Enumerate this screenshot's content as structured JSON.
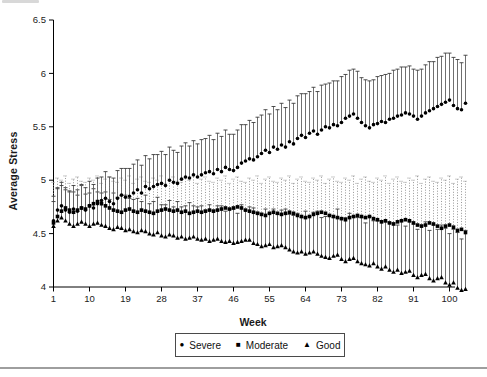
{
  "page": {
    "background": "#ffffff",
    "rule_color": "#9e9e9e"
  },
  "icons": {
    "circle_glyph": "●",
    "square_glyph": "■",
    "triangle_glyph": "▲"
  },
  "chart_data": {
    "type": "scatter",
    "title": "",
    "xlabel": "Week",
    "ylabel": "Average Stress",
    "xlim": [
      1,
      105
    ],
    "ylim": [
      4,
      6.5
    ],
    "grid": false,
    "legend_position": "bottom",
    "x_ticks": [
      1,
      10,
      19,
      28,
      37,
      46,
      55,
      64,
      73,
      82,
      91,
      100
    ],
    "y_ticks": [
      4,
      4.5,
      5,
      5.5,
      6,
      6.5
    ],
    "y_tick_labels": [
      "4",
      "4.5",
      "5",
      "5.5",
      "6",
      "6.5"
    ],
    "weeks_first": 1,
    "weeks_count": 104,
    "error_bar_note": "one-sided error bars drawn upward from each marker",
    "series": [
      {
        "name": "Severe",
        "marker": "circle",
        "bar_style": "solid",
        "bar_direction": "up",
        "values": [
          4.62,
          4.72,
          4.76,
          4.72,
          4.7,
          4.73,
          4.71,
          4.74,
          4.72,
          4.76,
          4.74,
          4.78,
          4.81,
          4.83,
          4.8,
          4.78,
          4.83,
          4.86,
          4.84,
          4.85,
          4.88,
          4.91,
          4.88,
          4.94,
          4.92,
          4.94,
          4.96,
          4.97,
          4.95,
          5.0,
          4.98,
          4.97,
          5.01,
          5.03,
          5.02,
          5.05,
          5.03,
          5.05,
          5.07,
          5.08,
          5.06,
          5.1,
          5.08,
          5.12,
          5.1,
          5.09,
          5.12,
          5.16,
          5.18,
          5.2,
          5.19,
          5.22,
          5.25,
          5.28,
          5.26,
          5.31,
          5.29,
          5.33,
          5.31,
          5.36,
          5.34,
          5.39,
          5.42,
          5.4,
          5.44,
          5.46,
          5.43,
          5.47,
          5.5,
          5.49,
          5.52,
          5.51,
          5.54,
          5.58,
          5.6,
          5.62,
          5.58,
          5.54,
          5.51,
          5.49,
          5.52,
          5.53,
          5.55,
          5.54,
          5.57,
          5.58,
          5.6,
          5.61,
          5.63,
          5.62,
          5.6,
          5.57,
          5.6,
          5.63,
          5.65,
          5.67,
          5.69,
          5.71,
          5.73,
          5.75,
          5.7,
          5.67,
          5.66,
          5.72
        ],
        "errors": [
          0.18,
          0.2,
          0.19,
          0.21,
          0.2,
          0.22,
          0.2,
          0.22,
          0.21,
          0.23,
          0.22,
          0.24,
          0.22,
          0.25,
          0.23,
          0.24,
          0.26,
          0.25,
          0.27,
          0.26,
          0.27,
          0.28,
          0.26,
          0.29,
          0.28,
          0.3,
          0.28,
          0.3,
          0.29,
          0.31,
          0.3,
          0.29,
          0.31,
          0.32,
          0.3,
          0.32,
          0.31,
          0.33,
          0.32,
          0.34,
          0.32,
          0.34,
          0.33,
          0.35,
          0.33,
          0.34,
          0.35,
          0.36,
          0.34,
          0.36,
          0.35,
          0.37,
          0.36,
          0.38,
          0.36,
          0.38,
          0.37,
          0.39,
          0.37,
          0.39,
          0.38,
          0.4,
          0.39,
          0.41,
          0.39,
          0.41,
          0.4,
          0.42,
          0.4,
          0.42,
          0.41,
          0.42,
          0.43,
          0.41,
          0.43,
          0.42,
          0.44,
          0.42,
          0.43,
          0.44,
          0.42,
          0.44,
          0.43,
          0.45,
          0.43,
          0.45,
          0.44,
          0.45,
          0.43,
          0.45,
          0.44,
          0.46,
          0.44,
          0.45,
          0.46,
          0.44,
          0.46,
          0.45,
          0.46,
          0.44,
          0.45,
          0.46,
          0.44,
          0.45
        ]
      },
      {
        "name": "Moderate",
        "marker": "square",
        "bar_style": "dotted",
        "bar_direction": "up",
        "values": [
          4.6,
          4.66,
          4.71,
          4.74,
          4.72,
          4.7,
          4.72,
          4.74,
          4.73,
          4.76,
          4.78,
          4.8,
          4.78,
          4.76,
          4.74,
          4.72,
          4.71,
          4.7,
          4.72,
          4.73,
          4.71,
          4.7,
          4.72,
          4.71,
          4.7,
          4.69,
          4.71,
          4.72,
          4.73,
          4.72,
          4.71,
          4.72,
          4.7,
          4.71,
          4.69,
          4.7,
          4.71,
          4.7,
          4.71,
          4.72,
          4.71,
          4.72,
          4.73,
          4.74,
          4.73,
          4.74,
          4.75,
          4.74,
          4.72,
          4.71,
          4.7,
          4.69,
          4.68,
          4.67,
          4.69,
          4.7,
          4.69,
          4.68,
          4.69,
          4.7,
          4.69,
          4.67,
          4.66,
          4.65,
          4.66,
          4.68,
          4.69,
          4.7,
          4.69,
          4.67,
          4.66,
          4.65,
          4.64,
          4.63,
          4.65,
          4.66,
          4.67,
          4.66,
          4.65,
          4.66,
          4.64,
          4.63,
          4.61,
          4.62,
          4.6,
          4.59,
          4.61,
          4.62,
          4.63,
          4.62,
          4.6,
          4.58,
          4.57,
          4.58,
          4.6,
          4.59,
          4.57,
          4.55,
          4.57,
          4.58,
          4.56,
          4.53,
          4.54,
          4.51
        ],
        "errors": [
          0.38,
          0.36,
          0.29,
          0.3,
          0.25,
          0.31,
          0.31,
          0.25,
          0.25,
          0.26,
          0.22,
          0.24,
          0.19,
          0.25,
          0.29,
          0.27,
          0.27,
          0.32,
          0.28,
          0.31,
          0.26,
          0.31,
          0.31,
          0.28,
          0.28,
          0.33,
          0.29,
          0.32,
          0.24,
          0.29,
          0.32,
          0.27,
          0.28,
          0.31,
          0.31,
          0.34,
          0.26,
          0.31,
          0.32,
          0.27,
          0.27,
          0.3,
          0.27,
          0.3,
          0.24,
          0.27,
          0.28,
          0.25,
          0.26,
          0.31,
          0.3,
          0.35,
          0.29,
          0.34,
          0.34,
          0.29,
          0.29,
          0.34,
          0.31,
          0.34,
          0.28,
          0.34,
          0.37,
          0.34,
          0.32,
          0.34,
          0.31,
          0.34,
          0.28,
          0.34,
          0.37,
          0.34,
          0.34,
          0.39,
          0.35,
          0.38,
          0.3,
          0.35,
          0.38,
          0.33,
          0.34,
          0.39,
          0.39,
          0.42,
          0.37,
          0.42,
          0.42,
          0.37,
          0.35,
          0.4,
          0.4,
          0.46,
          0.4,
          0.43,
          0.43,
          0.4,
          0.41,
          0.47,
          0.43,
          0.46,
          0.41,
          0.48,
          0.49,
          0.48
        ]
      },
      {
        "name": "Good",
        "marker": "triangle",
        "bar_style": "solid",
        "bar_direction": "up",
        "values": [
          4.57,
          4.62,
          4.65,
          4.62,
          4.59,
          4.57,
          4.59,
          4.61,
          4.59,
          4.57,
          4.59,
          4.6,
          4.58,
          4.57,
          4.55,
          4.54,
          4.56,
          4.55,
          4.53,
          4.54,
          4.52,
          4.51,
          4.53,
          4.52,
          4.5,
          4.49,
          4.51,
          4.48,
          4.47,
          4.49,
          4.48,
          4.46,
          4.47,
          4.45,
          4.46,
          4.47,
          4.45,
          4.44,
          4.45,
          4.43,
          4.44,
          4.45,
          4.43,
          4.42,
          4.43,
          4.41,
          4.42,
          4.43,
          4.44,
          4.44,
          4.41,
          4.4,
          4.38,
          4.39,
          4.4,
          4.37,
          4.38,
          4.39,
          4.37,
          4.35,
          4.33,
          4.32,
          4.33,
          4.31,
          4.32,
          4.33,
          4.31,
          4.29,
          4.28,
          4.27,
          4.29,
          4.3,
          4.26,
          4.24,
          4.26,
          4.27,
          4.24,
          4.22,
          4.21,
          4.2,
          4.22,
          4.19,
          4.17,
          4.19,
          4.16,
          4.14,
          4.16,
          4.13,
          4.14,
          4.15,
          4.11,
          4.09,
          4.11,
          4.12,
          4.08,
          4.06,
          4.08,
          4.09,
          4.04,
          4.02,
          4.04,
          3.99,
          3.97,
          3.98
        ],
        "errors": [
          0.28,
          0.31,
          0.33,
          0.29,
          0.3,
          0.32,
          0.27,
          0.34,
          0.28,
          0.31,
          0.33,
          0.29,
          0.3,
          0.32,
          0.27,
          0.34,
          0.28,
          0.31,
          0.33,
          0.29,
          0.3,
          0.32,
          0.27,
          0.34,
          0.28,
          0.31,
          0.33,
          0.29,
          0.3,
          0.32,
          0.27,
          0.34,
          0.28,
          0.31,
          0.33,
          0.29,
          0.3,
          0.32,
          0.27,
          0.34,
          0.28,
          0.31,
          0.33,
          0.29,
          0.3,
          0.32,
          0.27,
          0.34,
          0.28,
          0.31,
          0.33,
          0.3,
          0.31,
          0.34,
          0.29,
          0.36,
          0.3,
          0.33,
          0.36,
          0.33,
          0.34,
          0.37,
          0.32,
          0.4,
          0.34,
          0.37,
          0.4,
          0.36,
          0.38,
          0.4,
          0.36,
          0.43,
          0.38,
          0.41,
          0.43,
          0.39,
          0.41,
          0.43,
          0.39,
          0.46,
          0.4,
          0.43,
          0.45,
          0.42,
          0.44,
          0.46,
          0.42,
          0.49,
          0.43,
          0.46,
          0.48,
          0.45,
          0.47,
          0.49,
          0.45,
          0.52,
          0.46,
          0.49,
          0.51,
          0.48,
          0.5,
          0.52,
          0.48,
          0.55
        ]
      }
    ]
  }
}
